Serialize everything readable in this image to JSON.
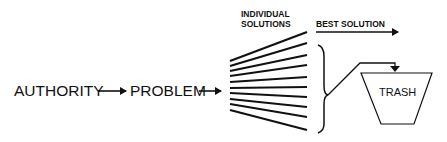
{
  "diagram": {
    "nodes": {
      "authority": "AUTHORITY",
      "problem": "PROBLEM",
      "individual_solutions_line1": "INDIVIDUAL",
      "individual_solutions_line2": "SOLUTIONS",
      "best_solution": "BEST SOLUTION",
      "trash": "TRASH"
    },
    "edges": [
      {
        "from": "AUTHORITY",
        "to": "PROBLEM"
      },
      {
        "from": "PROBLEM",
        "to": "INDIVIDUAL SOLUTIONS"
      },
      {
        "from": "INDIVIDUAL SOLUTIONS",
        "to": "BEST SOLUTION"
      },
      {
        "from": "INDIVIDUAL SOLUTIONS (rest)",
        "to": "TRASH"
      }
    ],
    "fan_line_count": 10,
    "colors": {
      "ink": "#111111",
      "background": "#ffffff"
    }
  }
}
